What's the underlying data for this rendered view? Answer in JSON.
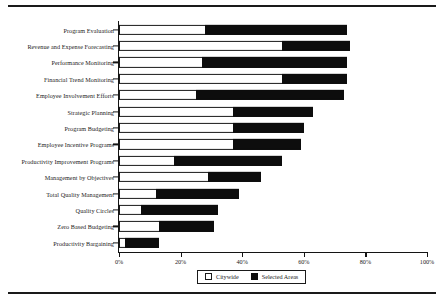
{
  "chart_data": {
    "type": "bar",
    "orientation": "horizontal",
    "stacked": true,
    "title": "",
    "xlabel": "",
    "ylabel": "",
    "xlim": [
      0,
      100
    ],
    "xticks": [
      "0%",
      "20%",
      "40%",
      "60%",
      "80%",
      "100%"
    ],
    "xtick_values": [
      0,
      20,
      40,
      60,
      80,
      100
    ],
    "grid": false,
    "legend_position": "bottom-center",
    "categories": [
      "Program Evaluation",
      "Revenue and Expense Forecasting",
      "Performance Monitoring",
      "Financial Trend Monitoring",
      "Employee Involvement Efforts",
      "Strategic Planning",
      "Program Budgeting",
      "Employee Incentive Programs",
      "Productivity Improvement Programs",
      "Management by Objectives",
      "Total Quality Management",
      "Quality Circles",
      "Zero Based Budgeting",
      "Productivity Bargaining"
    ],
    "series": [
      {
        "name": "Citywide",
        "color": "#ffffff",
        "values": [
          28,
          53,
          27,
          53,
          25,
          37,
          37,
          37,
          18,
          29,
          12,
          7,
          13,
          2
        ]
      },
      {
        "name": "Selected Areas",
        "color": "#0d0d0d",
        "values": [
          46,
          22,
          47,
          21,
          48,
          26,
          23,
          22,
          35,
          17,
          27,
          25,
          18,
          11
        ]
      }
    ],
    "totals": [
      74,
      75,
      74,
      74,
      73,
      63,
      60,
      59,
      53,
      46,
      39,
      32,
      31,
      13
    ]
  },
  "legend": {
    "items": [
      {
        "label": "Citywide",
        "swatch": "outline-square"
      },
      {
        "label": "Selected Areas",
        "swatch": "filled-square"
      }
    ]
  }
}
